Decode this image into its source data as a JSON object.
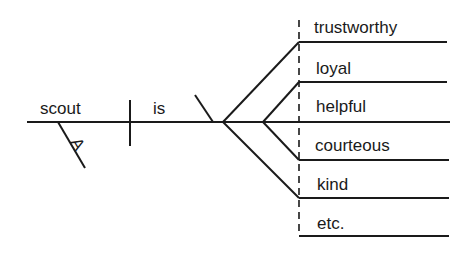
{
  "diagram": {
    "type": "sentence-diagram",
    "subject": "scout",
    "verb": "is",
    "article": "A",
    "predicate_adjectives": [
      "trustworthy",
      "loyal",
      "helpful",
      "courteous",
      "kind",
      "etc."
    ],
    "colors": {
      "ink": "#1a1a1a",
      "background": "#ffffff"
    }
  }
}
